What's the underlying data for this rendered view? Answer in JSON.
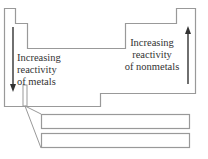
{
  "diagram": {
    "type": "periodic-table-outline",
    "metals_label": {
      "line1": "Increasing",
      "line2": "reactivity",
      "line3": "of metals",
      "arrow_direction": "down"
    },
    "nonmetals_label": {
      "line1": "Increasing",
      "line2": "reactivity",
      "line3": "of nonmetals",
      "arrow_direction": "up"
    },
    "colors": {
      "outline": "#999999",
      "arrow": "#333333",
      "text": "#333333",
      "background": "#ffffff"
    }
  }
}
